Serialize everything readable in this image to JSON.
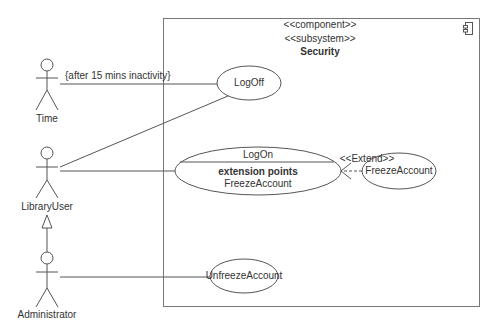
{
  "diagram": {
    "type": "UML use case diagram",
    "subsystem": {
      "stereotypes": [
        "<<component>>",
        "<<subsystem>>"
      ],
      "name": "Security",
      "icon": "component-icon"
    },
    "actors": [
      {
        "id": "time",
        "name": "Time"
      },
      {
        "id": "library_user",
        "name": "LibraryUser"
      },
      {
        "id": "administrator",
        "name": "Administrator"
      }
    ],
    "use_cases": [
      {
        "id": "logoff",
        "name": "LogOff"
      },
      {
        "id": "logon",
        "name": "LogOn",
        "compartment_title": "extension points",
        "extension_point": "FreezeAccount"
      },
      {
        "id": "freeze",
        "name": "FreezeAccount"
      },
      {
        "id": "unfreeze",
        "name": "UnfreezeAccount"
      }
    ],
    "relationships": [
      {
        "from": "time",
        "to": "logoff",
        "type": "association",
        "label": "{after 15 mins inactivity}"
      },
      {
        "from": "library_user",
        "to": "logoff",
        "type": "association"
      },
      {
        "from": "library_user",
        "to": "logon",
        "type": "association"
      },
      {
        "from": "freeze",
        "to": "logon",
        "type": "extend",
        "label": "<<Extend>>"
      },
      {
        "from": "administrator",
        "to": "library_user",
        "type": "generalization"
      },
      {
        "from": "administrator",
        "to": "unfreeze",
        "type": "association"
      }
    ]
  },
  "labels": {
    "stereo1": "<<component>>",
    "stereo2": "<<subsystem>>",
    "subsystem_name": "Security",
    "actor_time": "Time",
    "actor_library_user": "LibraryUser",
    "actor_admin": "Administrator",
    "uc_logoff": "LogOff",
    "uc_logon": "LogOn",
    "uc_logon_ext_title": "extension points",
    "uc_logon_ext_point": "FreezeAccount",
    "uc_freeze": "FreezeAccount",
    "uc_unfreeze": "UnfreezeAccount",
    "constraint": "{after 15 mins inactivity}",
    "extend": "<<Extend>>"
  }
}
